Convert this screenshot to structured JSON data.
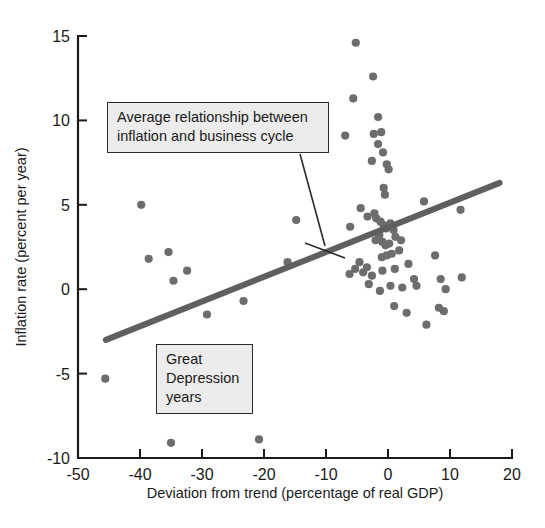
{
  "chart_data": {
    "type": "scatter",
    "title": "",
    "xlabel": "Deviation from trend (percentage of real GDP)",
    "ylabel": "Inflation rate (percent per year)",
    "xlim": [
      -50,
      20
    ],
    "ylim": [
      -10,
      15
    ],
    "xticks": [
      -50,
      -40,
      -30,
      -20,
      -10,
      0,
      10,
      20
    ],
    "xtick_labels": [
      "-50",
      "-40",
      "-30",
      "-20",
      "-10",
      "0",
      "10",
      "20"
    ],
    "yticks": [
      -10,
      -5,
      0,
      5,
      10,
      15
    ],
    "ytick_labels": [
      "-10",
      "-5",
      "0",
      "5",
      "10",
      "15"
    ],
    "grid": false,
    "legend": "none",
    "point_color": "#6d6d6d",
    "trend_color": "#5f5f5f",
    "points": [
      {
        "x": -45.6,
        "y": -5.3
      },
      {
        "x": -39.8,
        "y": 5.0
      },
      {
        "x": -38.6,
        "y": 1.8
      },
      {
        "x": -35.4,
        "y": 2.2
      },
      {
        "x": -34.6,
        "y": 0.5
      },
      {
        "x": -35.0,
        "y": -9.1
      },
      {
        "x": -32.4,
        "y": 1.1
      },
      {
        "x": -29.2,
        "y": -1.5
      },
      {
        "x": -23.3,
        "y": -0.7
      },
      {
        "x": -20.8,
        "y": -8.9
      },
      {
        "x": -16.2,
        "y": 1.6
      },
      {
        "x": -14.8,
        "y": 4.1
      },
      {
        "x": -5.2,
        "y": 14.6
      },
      {
        "x": -2.4,
        "y": 12.6
      },
      {
        "x": -5.6,
        "y": 11.3
      },
      {
        "x": -1.6,
        "y": 10.2
      },
      {
        "x": -6.9,
        "y": 9.1
      },
      {
        "x": -2.3,
        "y": 9.2
      },
      {
        "x": -1.1,
        "y": 9.3
      },
      {
        "x": -1.6,
        "y": 8.6
      },
      {
        "x": -0.8,
        "y": 8.1
      },
      {
        "x": -2.6,
        "y": 7.6
      },
      {
        "x": -0.2,
        "y": 7.4
      },
      {
        "x": 0.1,
        "y": 7.1
      },
      {
        "x": -0.7,
        "y": 6.0
      },
      {
        "x": -0.5,
        "y": 5.6
      },
      {
        "x": -4.4,
        "y": 4.8
      },
      {
        "x": -6.1,
        "y": 3.7
      },
      {
        "x": -3.3,
        "y": 4.3
      },
      {
        "x": -2.2,
        "y": 4.5
      },
      {
        "x": -1.9,
        "y": 4.2
      },
      {
        "x": -1.2,
        "y": 4.0
      },
      {
        "x": -0.7,
        "y": 3.8
      },
      {
        "x": -0.3,
        "y": 3.6
      },
      {
        "x": 0.4,
        "y": 3.9
      },
      {
        "x": 0.9,
        "y": 3.5
      },
      {
        "x": -1.4,
        "y": 3.2
      },
      {
        "x": -2.0,
        "y": 2.9
      },
      {
        "x": -0.9,
        "y": 2.8
      },
      {
        "x": -0.4,
        "y": 2.6
      },
      {
        "x": 0.2,
        "y": 2.7
      },
      {
        "x": 1.2,
        "y": 3.1
      },
      {
        "x": 2.1,
        "y": 2.9
      },
      {
        "x": 1.8,
        "y": 2.3
      },
      {
        "x": 0.6,
        "y": 2.1
      },
      {
        "x": -0.2,
        "y": 2.0
      },
      {
        "x": -1.0,
        "y": 1.9
      },
      {
        "x": -4.6,
        "y": 1.6
      },
      {
        "x": -5.3,
        "y": 1.2
      },
      {
        "x": -4.0,
        "y": 1.0
      },
      {
        "x": -3.4,
        "y": 1.3
      },
      {
        "x": -6.2,
        "y": 0.9
      },
      {
        "x": -2.6,
        "y": 0.8
      },
      {
        "x": -0.9,
        "y": 1.1
      },
      {
        "x": 1.1,
        "y": 1.2
      },
      {
        "x": 3.3,
        "y": 1.5
      },
      {
        "x": 4.2,
        "y": 0.6
      },
      {
        "x": 4.6,
        "y": 0.2
      },
      {
        "x": 2.3,
        "y": 0.1
      },
      {
        "x": 0.4,
        "y": 0.2
      },
      {
        "x": -1.3,
        "y": -0.1
      },
      {
        "x": -3.1,
        "y": 0.3
      },
      {
        "x": 1.0,
        "y": -1.0
      },
      {
        "x": 3.0,
        "y": -1.4
      },
      {
        "x": 8.5,
        "y": 0.6
      },
      {
        "x": 9.3,
        "y": 0.0
      },
      {
        "x": 8.2,
        "y": -1.1
      },
      {
        "x": 9.0,
        "y": -1.3
      },
      {
        "x": 11.7,
        "y": 4.7
      },
      {
        "x": 11.9,
        "y": 0.7
      },
      {
        "x": 6.2,
        "y": -2.1
      },
      {
        "x": 7.6,
        "y": 2.0
      },
      {
        "x": 5.8,
        "y": 5.2
      }
    ],
    "trend_line": {
      "x_start": -45.5,
      "y_start": -3.0,
      "x_end": 18.0,
      "y_end": 6.3
    },
    "annotations": [
      {
        "id": "trend-callout",
        "text": "Average relationship between\ninflation and business cycle"
      },
      {
        "id": "depression-callout",
        "text": "Great\nDepression\nyears"
      }
    ]
  }
}
